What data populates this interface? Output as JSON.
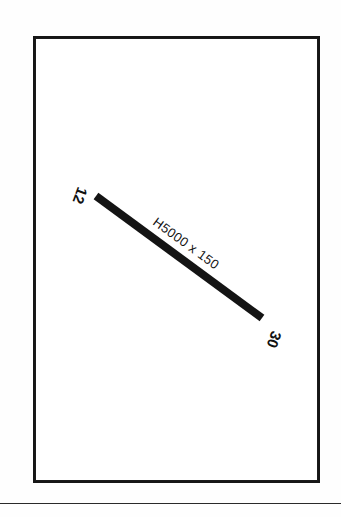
{
  "drawing": {
    "title": "Structural beam member drawing",
    "frame": {
      "name": "drawing-border",
      "color": "#161616",
      "x": 33,
      "y": 36,
      "width": 287,
      "height": 447
    },
    "member": {
      "label": "H5000 x 150",
      "color": "#141414",
      "thickness": 8,
      "start": {
        "x": 96,
        "y": 196
      },
      "end": {
        "x": 262,
        "y": 318
      }
    },
    "nodes": [
      {
        "id": "start-node",
        "label": "12",
        "x": 78,
        "y": 186,
        "rotation": 110
      },
      {
        "id": "end-node",
        "label": "30",
        "x": 272,
        "y": 330,
        "rotation": 110
      }
    ],
    "member_label": {
      "text": "H5000 x 150",
      "x": 152,
      "y": 224,
      "rotation": 36
    },
    "bottom_rule": {
      "name": "page-separator-rule",
      "color": "#2a2a2a",
      "y": 503
    }
  }
}
